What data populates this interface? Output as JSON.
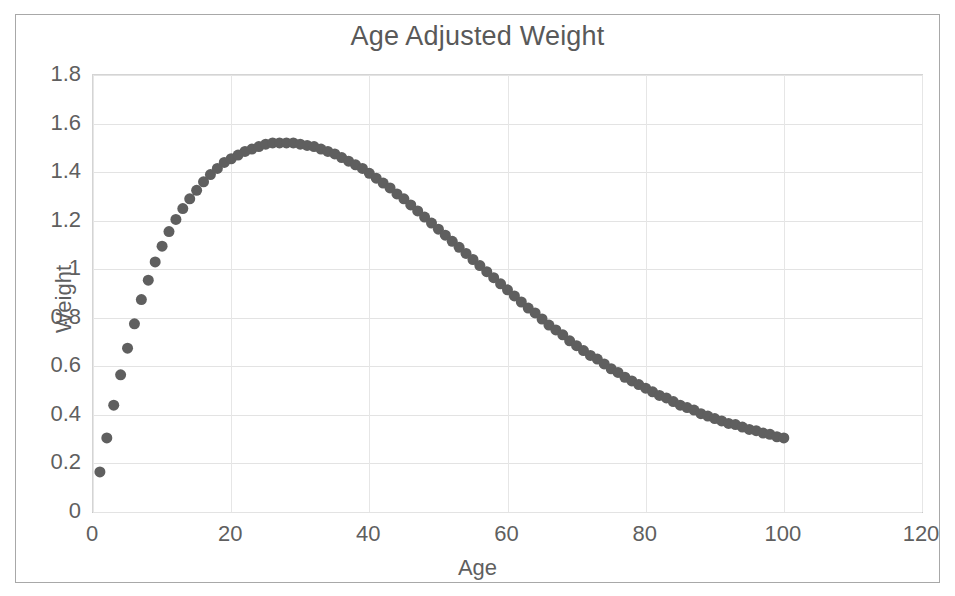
{
  "chart_data": {
    "type": "scatter",
    "title": "Age Adjusted Weight",
    "xlabel": "Age",
    "ylabel": "Weight",
    "xlim": [
      0,
      120
    ],
    "ylim": [
      0,
      1.8
    ],
    "xticks": [
      0,
      20,
      40,
      60,
      80,
      100,
      120
    ],
    "yticks": [
      0,
      0.2,
      0.4,
      0.6,
      0.8,
      1,
      1.2,
      1.4,
      1.6,
      1.8
    ],
    "xtick_labels": [
      "0",
      "20",
      "40",
      "60",
      "80",
      "100",
      "120"
    ],
    "ytick_labels": [
      "0",
      "0.2",
      "0.4",
      "0.6",
      "0.8",
      "1",
      "1.2",
      "1.4",
      "1.6",
      "1.8"
    ],
    "grid": true,
    "legend": false,
    "marker_color": "#5f5f5f",
    "marker_size": 11,
    "series": [
      {
        "name": "Age Adjusted Weight",
        "x": [
          1,
          2,
          3,
          4,
          5,
          6,
          7,
          8,
          9,
          10,
          11,
          12,
          13,
          14,
          15,
          16,
          17,
          18,
          19,
          20,
          21,
          22,
          23,
          24,
          25,
          26,
          27,
          28,
          29,
          30,
          31,
          32,
          33,
          34,
          35,
          36,
          37,
          38,
          39,
          40,
          41,
          42,
          43,
          44,
          45,
          46,
          47,
          48,
          49,
          50,
          51,
          52,
          53,
          54,
          55,
          56,
          57,
          58,
          59,
          60,
          61,
          62,
          63,
          64,
          65,
          66,
          67,
          68,
          69,
          70,
          71,
          72,
          73,
          74,
          75,
          76,
          77,
          78,
          79,
          80,
          81,
          82,
          83,
          84,
          85,
          86,
          87,
          88,
          89,
          90,
          91,
          92,
          93,
          94,
          95,
          96,
          97,
          98,
          99,
          100
        ],
        "values": [
          0.165,
          0.305,
          0.44,
          0.565,
          0.675,
          0.775,
          0.875,
          0.955,
          1.03,
          1.095,
          1.155,
          1.205,
          1.25,
          1.29,
          1.325,
          1.36,
          1.39,
          1.415,
          1.44,
          1.455,
          1.47,
          1.485,
          1.495,
          1.505,
          1.515,
          1.52,
          1.52,
          1.52,
          1.52,
          1.515,
          1.51,
          1.505,
          1.495,
          1.485,
          1.475,
          1.46,
          1.445,
          1.43,
          1.415,
          1.395,
          1.375,
          1.355,
          1.335,
          1.31,
          1.29,
          1.265,
          1.24,
          1.215,
          1.19,
          1.165,
          1.14,
          1.115,
          1.09,
          1.065,
          1.04,
          1.015,
          0.99,
          0.965,
          0.94,
          0.915,
          0.89,
          0.865,
          0.84,
          0.82,
          0.795,
          0.77,
          0.75,
          0.73,
          0.705,
          0.685,
          0.665,
          0.645,
          0.63,
          0.61,
          0.59,
          0.575,
          0.555,
          0.54,
          0.525,
          0.51,
          0.495,
          0.48,
          0.47,
          0.455,
          0.44,
          0.43,
          0.42,
          0.405,
          0.395,
          0.385,
          0.375,
          0.365,
          0.36,
          0.35,
          0.34,
          0.335,
          0.325,
          0.32,
          0.31,
          0.305
        ]
      }
    ]
  }
}
